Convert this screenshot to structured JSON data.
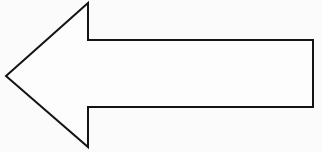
{
  "canvas": {
    "width": 322,
    "height": 152,
    "background_color": "#fbfbfb",
    "title": "Left-pointing arrow outline"
  },
  "shape": {
    "name": "left-arrow",
    "kind": "polygon-outline",
    "description": "Hollow left-pointing block arrow",
    "direction": "left",
    "fill_color": "#fdfdfd",
    "stroke_color": "#141414",
    "stroke_width": 2,
    "points": "6,76 88,3 88,40 313,40 313,107 88,107 88,147",
    "vertices": [
      {
        "label": "tip",
        "x": 6,
        "y": 76
      },
      {
        "label": "head-top-apex",
        "x": 88,
        "y": 3
      },
      {
        "label": "notch-top",
        "x": 88,
        "y": 40
      },
      {
        "label": "shaft-top-right",
        "x": 313,
        "y": 40
      },
      {
        "label": "shaft-bottom-right",
        "x": 313,
        "y": 107
      },
      {
        "label": "notch-bottom",
        "x": 88,
        "y": 107
      },
      {
        "label": "head-bottom-apex",
        "x": 88,
        "y": 147
      }
    ],
    "metrics": {
      "head_width": 82,
      "head_height": 144,
      "shaft_height": 67,
      "shaft_length": 225
    }
  }
}
